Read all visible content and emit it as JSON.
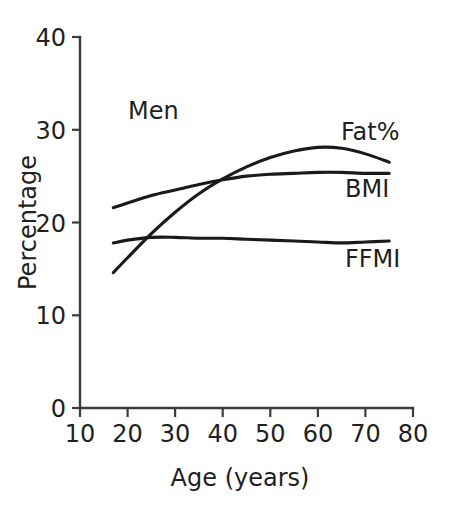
{
  "chart_data": {
    "type": "line",
    "title": "",
    "panel_label": "Men",
    "xlabel": "Age (years)",
    "ylabel": "Percentage",
    "xlim": [
      10,
      80
    ],
    "ylim": [
      0,
      40
    ],
    "xticks": [
      10,
      20,
      30,
      40,
      50,
      60,
      70,
      80
    ],
    "xtick_labels": [
      "10",
      "20",
      "30",
      "40",
      "50",
      "60",
      "70",
      "80"
    ],
    "yticks": [
      0,
      10,
      20,
      30,
      40
    ],
    "ytick_labels": [
      "0",
      "10",
      "20",
      "30",
      "40"
    ],
    "grid": false,
    "legend_position": "inline-right-of-curve-ends",
    "x": [
      17,
      20,
      25,
      30,
      35,
      40,
      45,
      50,
      55,
      60,
      65,
      70,
      75
    ],
    "series": [
      {
        "name": "Fat%",
        "label": "Fat%",
        "color": "#1a1a1a",
        "values": [
          14.6,
          16.2,
          18.8,
          21.1,
          23.1,
          24.7,
          26.0,
          27.0,
          27.7,
          28.1,
          28.0,
          27.4,
          26.5
        ]
      },
      {
        "name": "BMI",
        "label": "BMI",
        "color": "#1a1a1a",
        "values": [
          21.6,
          22.1,
          22.9,
          23.5,
          24.1,
          24.6,
          25.0,
          25.2,
          25.3,
          25.4,
          25.4,
          25.3,
          25.3
        ]
      },
      {
        "name": "FFMI",
        "label": "FFMI",
        "color": "#1a1a1a",
        "values": [
          17.8,
          18.1,
          18.4,
          18.4,
          18.3,
          18.3,
          18.2,
          18.1,
          18.0,
          17.9,
          17.8,
          17.9,
          18.0
        ]
      }
    ],
    "annotations": [
      {
        "text": "Men",
        "x": 20,
        "y": 32
      },
      {
        "text": "Fat%",
        "x": 64,
        "y": 30
      },
      {
        "text": "BMI",
        "x": 65,
        "y": 24.4
      },
      {
        "text": "FFMI",
        "x": 65,
        "y": 16.8
      }
    ]
  },
  "axes": {
    "y_title": "Percentage",
    "x_title": "Age (years)"
  }
}
